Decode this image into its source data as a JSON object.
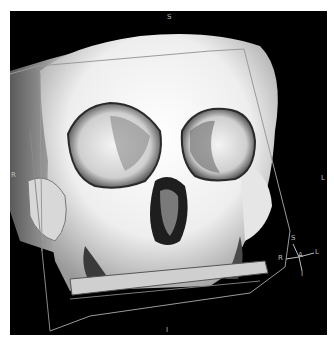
{
  "viewer": {
    "type": "3D volume rendering",
    "subject": "skull (frontal view)",
    "background_color": "#000000",
    "frame_color": "#ffffff",
    "bounding_box_color": "#9a9a9a"
  },
  "orientation_labels": {
    "top": "S",
    "bottom": "I",
    "left": "R",
    "right": "L"
  },
  "orientation_widget": {
    "superior": "S",
    "right": "R",
    "anterior": "A",
    "left": "L",
    "inferior": "I"
  }
}
